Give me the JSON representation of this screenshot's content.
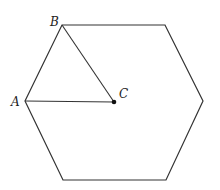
{
  "figure": {
    "shape": "regular hexagon",
    "stroke_color": "#333333",
    "vertices": [
      [
        25,
        101
      ],
      [
        62,
        25
      ],
      [
        165,
        25
      ],
      [
        203,
        101
      ],
      [
        166,
        180
      ],
      [
        63,
        180
      ]
    ],
    "center": {
      "label": "C",
      "x": 114,
      "y": 102
    },
    "labels": {
      "A": {
        "text": "A",
        "x": 25,
        "y": 101
      },
      "B": {
        "text": "B",
        "x": 62,
        "y": 25
      },
      "C": {
        "text": "C",
        "x": 114,
        "y": 102
      }
    },
    "segments": [
      {
        "from": "A",
        "to": "C"
      },
      {
        "from": "B",
        "to": "C"
      }
    ]
  }
}
